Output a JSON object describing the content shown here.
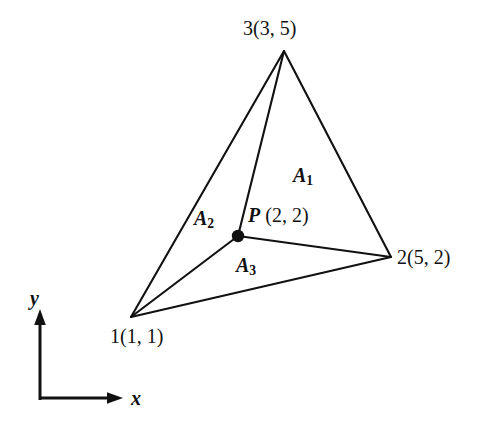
{
  "figure": {
    "background_color": "#ffffff",
    "stroke_color": "#111111",
    "geometry": {
      "triangle_vertices_px": [
        {
          "id": "1",
          "x": 131,
          "y": 317
        },
        {
          "id": "2",
          "x": 391,
          "y": 257
        },
        {
          "id": "3",
          "x": 284,
          "y": 51
        }
      ],
      "interior_point_px": {
        "x": 238,
        "y": 236
      }
    },
    "vertices": [
      {
        "name": "vertex-1",
        "label": "1(1, 1)",
        "node": "1",
        "coords": "(1, 1)"
      },
      {
        "name": "vertex-2",
        "label": "2(5, 2)",
        "node": "2",
        "coords": "(5, 2)"
      },
      {
        "name": "vertex-3",
        "label": "3(3, 5)",
        "node": "3",
        "coords": "(3, 5)"
      }
    ],
    "interior_point": {
      "symbol": "P",
      "coords": "(2, 2)",
      "label": "P (2, 2)"
    },
    "areas": [
      {
        "name": "area-a1",
        "symbol": "A",
        "subscript": "1",
        "label": "A1"
      },
      {
        "name": "area-a2",
        "symbol": "A",
        "subscript": "2",
        "label": "A2"
      },
      {
        "name": "area-a3",
        "symbol": "A",
        "subscript": "3",
        "label": "A3"
      }
    ],
    "axes": {
      "x_label": "x",
      "y_label": "y",
      "origin_px": {
        "x": 40,
        "y": 398
      }
    }
  }
}
